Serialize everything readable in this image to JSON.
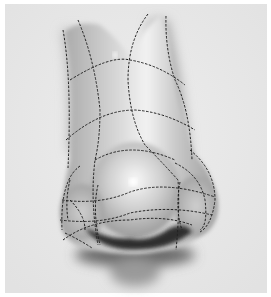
{
  "image": {
    "subject": "nose-drawing-with-contour-lines",
    "background_color": "#e9e9e9",
    "border_color": "#ffffff",
    "shading_dark": "#3a3a3a",
    "line_color": "#222222"
  }
}
